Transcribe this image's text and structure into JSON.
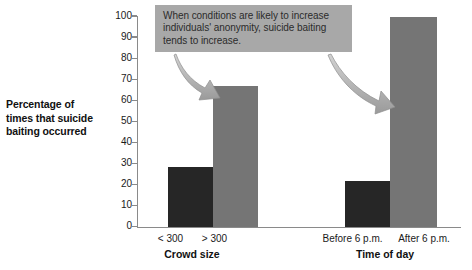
{
  "chart_data": {
    "type": "bar",
    "title": "",
    "subtitle": "",
    "xlabel": "",
    "ylabel": "Percentage of times that suicide baiting occurred",
    "ylim": [
      0,
      100
    ],
    "yticks": [
      0,
      10,
      20,
      30,
      40,
      50,
      60,
      70,
      80,
      90,
      100
    ],
    "grid": false,
    "legend": false,
    "groups": [
      {
        "name": "Crowd size",
        "categories": [
          "< 300",
          "> 300"
        ],
        "values": [
          28.5,
          67
        ],
        "colors": [
          "#262626",
          "#757575"
        ]
      },
      {
        "name": "Time of day",
        "categories": [
          "Before 6 p.m.",
          "After 6 p.m."
        ],
        "values": [
          22,
          99.5
        ],
        "colors": [
          "#262626",
          "#757575"
        ]
      }
    ],
    "categories": [
      "< 300",
      "> 300",
      "Before 6 p.m.",
      "After 6 p.m."
    ],
    "values": [
      28.5,
      67,
      22,
      99.5
    ],
    "annotations": [
      {
        "text": "When conditions are likely to increase individuals' anonymity, suicide baiting tends to increase.",
        "points_to": [
          "> 300",
          "After 6 p.m."
        ]
      }
    ]
  },
  "axis": {
    "y_label_line1": "Percentage of",
    "y_label_line2": "times that suicide",
    "y_label_line3": "baiting occurred",
    "ticks": [
      "100",
      "90",
      "80",
      "70",
      "60",
      "50",
      "40",
      "30",
      "20",
      "10",
      "0"
    ]
  },
  "groups": {
    "crowd_size": {
      "label": "Crowd size",
      "cat1": "< 300",
      "cat2": "> 300"
    },
    "time_of_day": {
      "label": "Time of day",
      "cat1": "Before 6 p.m.",
      "cat2": "After 6 p.m."
    }
  },
  "callout": {
    "text": "When conditions are likely to increase individuals' anonymity, suicide baiting tends to increase."
  },
  "colors": {
    "bar_dark": "#262626",
    "bar_gray": "#757575",
    "callout_bg": "#a8a8a8",
    "axis": "#8a8a8a",
    "arrow": "#b0b0b0"
  }
}
